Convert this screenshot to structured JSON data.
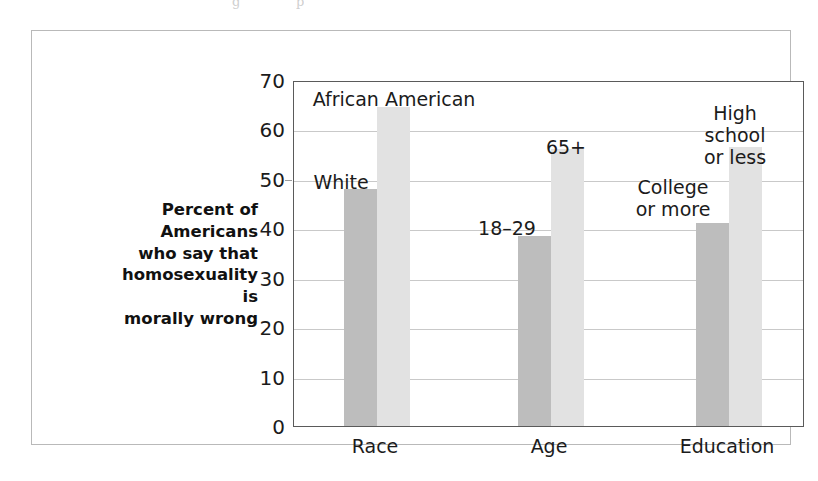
{
  "figure": {
    "scan_artifacts": [
      "g",
      "p"
    ]
  },
  "chart_data": {
    "type": "bar",
    "title": "",
    "xlabel": "",
    "ylabel": "Percent of\nAmericans\nwho say that\nhomosexuality is\nmorally wrong",
    "ylabel_lines": [
      "Percent of",
      "Americans",
      "who say that",
      "homosexuality is",
      "morally wrong"
    ],
    "categories": [
      "Race",
      "Age",
      "Education"
    ],
    "ylim": [
      0,
      70
    ],
    "yticks": [
      0,
      10,
      20,
      30,
      40,
      50,
      60,
      70
    ],
    "ytick_labels": [
      "0",
      "10",
      "20",
      "30",
      "40",
      "50",
      "60",
      "70"
    ],
    "grid": true,
    "gridlines_at": [
      10,
      20,
      30,
      40,
      50,
      60
    ],
    "legend": "none (bars labeled in-plot)",
    "series": [
      {
        "name": "lower-percentage group",
        "color": "#bdbdbd",
        "points": [
          {
            "category": "Race",
            "label": "White",
            "value": 48
          },
          {
            "category": "Age",
            "label": "18–29",
            "value": 38.5
          },
          {
            "category": "Education",
            "label": "College\nor more",
            "value": 41
          }
        ]
      },
      {
        "name": "higher-percentage group",
        "color": "#e2e2e2",
        "points": [
          {
            "category": "Race",
            "label": "African American",
            "value": 64.5
          },
          {
            "category": "Age",
            "label": "65+",
            "value": 56
          },
          {
            "category": "Education",
            "label": "High school\nor less",
            "value": 56.5
          }
        ]
      }
    ],
    "annotations": [
      {
        "text": "African American",
        "value": 64.5
      },
      {
        "text": "White",
        "value": 48
      },
      {
        "text": "65+",
        "value": 56
      },
      {
        "text": "18–29",
        "value": 38.5
      },
      {
        "text": "High school\nor less",
        "value": 56.5
      },
      {
        "text": "College\nor more",
        "value": 41
      }
    ],
    "colors": {
      "bar_dark": "#bdbdbd",
      "bar_light": "#e2e2e2",
      "axis": "#5a5a5a",
      "grid": "#c9c9c9",
      "text": "#1b1b1b",
      "frame": "#b9b9b9",
      "background": "#ffffff"
    }
  }
}
